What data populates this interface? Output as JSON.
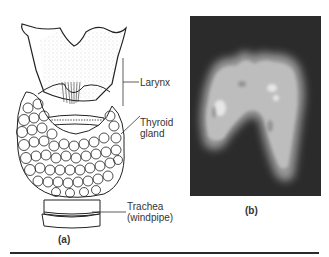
{
  "figure": {
    "panel_a": {
      "caption": "(a)",
      "labels": {
        "larynx": "Larynx",
        "thyroid_line1": "Thyroid",
        "thyroid_line2": "gland",
        "trachea_line1": "Trachea",
        "trachea_line2": "(windpipe)"
      }
    },
    "panel_b": {
      "caption": "(b)",
      "scan_background": "#2b2b2b",
      "scan_foreground": "#bdbdbd"
    }
  }
}
